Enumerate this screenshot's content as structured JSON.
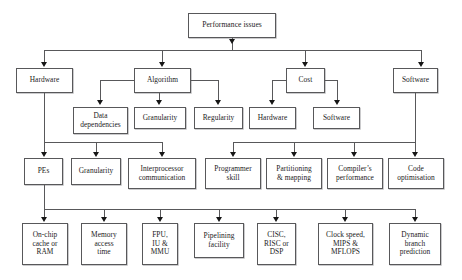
{
  "diagram": {
    "type": "tree-diagram",
    "orientation": "top-down",
    "colors": {
      "box_border": "#58585a",
      "box_fill": "#ffffff",
      "connector": "#58585a",
      "arrow": "#161616",
      "text": "#1c1c1c",
      "background": "#ffffff"
    },
    "levels": [
      {
        "index": 0,
        "name": "root"
      },
      {
        "index": 1,
        "name": "categories"
      },
      {
        "index": 2,
        "name": "subcategories"
      },
      {
        "index": 3,
        "name": "factors"
      },
      {
        "index": 4,
        "name": "details"
      }
    ]
  },
  "nodes": {
    "root": {
      "label": "Performance issues"
    },
    "level1": [
      {
        "id": "hardware",
        "label": "Hardware"
      },
      {
        "id": "algorithm",
        "label": "Algorithm"
      },
      {
        "id": "cost",
        "label": "Cost"
      },
      {
        "id": "software",
        "label": "Software"
      }
    ],
    "level2": [
      {
        "id": "data-dependencies",
        "label": "Data\ndependencies"
      },
      {
        "id": "granularity-alg",
        "label": "Granularity"
      },
      {
        "id": "regularity",
        "label": "Regularity"
      },
      {
        "id": "hardware-cost",
        "label": "Hardware"
      },
      {
        "id": "software-cost",
        "label": "Software"
      }
    ],
    "level3": [
      {
        "id": "pes",
        "label": "PEs"
      },
      {
        "id": "granularity",
        "label": "Granularity"
      },
      {
        "id": "interprocessor-communication",
        "label": "Interprocessor\ncommunication"
      },
      {
        "id": "programmer-skill",
        "label": "Programmer\nskill"
      },
      {
        "id": "partitioning-mapping",
        "label": "Partitioning\n& mapping"
      },
      {
        "id": "compilers-performance",
        "label": "Compiler’s\nperformance"
      },
      {
        "id": "code-optimisation",
        "label": "Code\noptimisation"
      }
    ],
    "level4": [
      {
        "id": "on-chip-cache-or-ram",
        "label": "On-chip\ncache or\nRAM"
      },
      {
        "id": "memory-access-time",
        "label": "Memory\naccess\ntime"
      },
      {
        "id": "fpu-iu-mmu",
        "label": "FPU,\nIU &\nMMU"
      },
      {
        "id": "pipelining-facility",
        "label": "Pipelining\nfacility"
      },
      {
        "id": "cisc-risc-dsp",
        "label": "CISC,\nRISC or\nDSP"
      },
      {
        "id": "clock-speed-mips-mflops",
        "label": "Clock speed,\nMIPS &\nMFLOPS"
      },
      {
        "id": "dynamic-branch-prediction",
        "label": "Dynamic\nbranch\nprediction"
      }
    ]
  }
}
